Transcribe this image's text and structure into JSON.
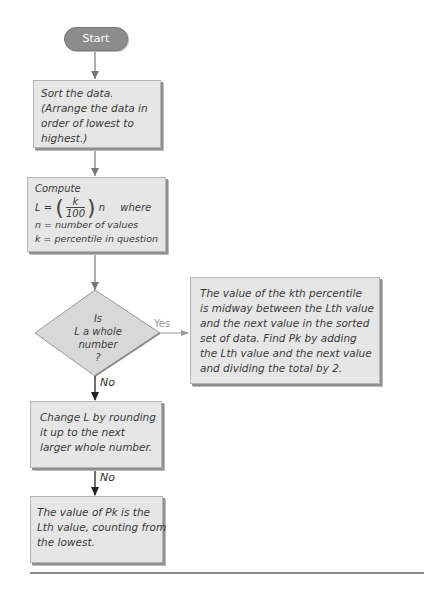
{
  "flowchart": {
    "start": {
      "label": "Start"
    },
    "sort_box": {
      "lines": [
        "Sort the data.",
        "(Arrange the data in",
        "order of lowest to",
        "highest.)"
      ]
    },
    "compute_box": {
      "title": "Compute",
      "formula_lhs": "L =",
      "frac_num": "k",
      "frac_den": "100",
      "formula_rhs": "n",
      "where": "where",
      "def_n": "n = number of values",
      "def_k": "k = percentile in question"
    },
    "decision": {
      "lines": [
        "Is",
        "L a whole",
        "number",
        "?"
      ]
    },
    "yes_label": "Yes",
    "no_label_1": "No",
    "no_label_2": "No",
    "yes_box": {
      "lines": [
        "The value of the kth percentile",
        "is midway between the Lth value",
        "and the next value in the sorted",
        "set of data. Find Pk by adding",
        "the Lth value and the next value",
        "and dividing the total by 2."
      ]
    },
    "change_box": {
      "lines": [
        "Change L by rounding",
        "it up to the next",
        "larger whole number."
      ]
    },
    "final_box": {
      "lines": [
        "The value of Pk is the",
        "Lth value, counting from",
        "the lowest."
      ]
    }
  },
  "colors": {
    "box_fill": "#e6e6e6",
    "pill_fill": "#8c8c8c",
    "arrow": "#444444",
    "yes_arrow": "#9a9a9a"
  }
}
